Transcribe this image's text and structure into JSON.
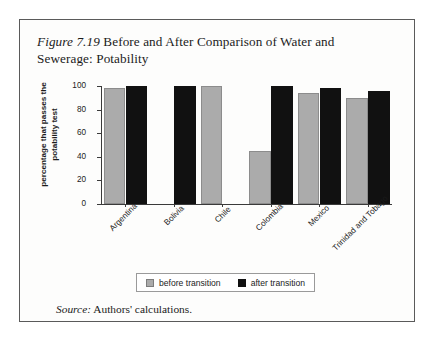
{
  "figure": {
    "number": "Figure 7.19",
    "title_rest": " Before and After Comparison of Water and Sewerage: Potability",
    "source_label": "Source:",
    "source_text": " Authors' calculations."
  },
  "legend": {
    "before_label": "before transition",
    "after_label": "after transition",
    "before_color": "#ababab",
    "after_color": "#111111"
  },
  "chart_data": {
    "type": "bar",
    "title": "Figure 7.19 Before and After Comparison of Water and Sewerage: Potability",
    "xlabel": "",
    "ylabel": "percentage that passes the potability test",
    "ylim": [
      0,
      100
    ],
    "yticks": [
      0,
      20,
      40,
      60,
      80,
      100
    ],
    "ytick_labels": [
      "0",
      "20",
      "40",
      "60",
      "80",
      "100"
    ],
    "grid": false,
    "legend_position": "bottom-center",
    "categories": [
      "Argentina",
      "Bolivia",
      "Chile",
      "Colombia",
      "Mexico",
      "Trinidad and Tobago"
    ],
    "series": [
      {
        "name": "before transition",
        "color": "#ababab",
        "values": [
          98,
          null,
          100,
          45,
          94,
          90
        ]
      },
      {
        "name": "after transition",
        "color": "#111111",
        "values": [
          100,
          100,
          null,
          100,
          98,
          96
        ]
      }
    ]
  }
}
